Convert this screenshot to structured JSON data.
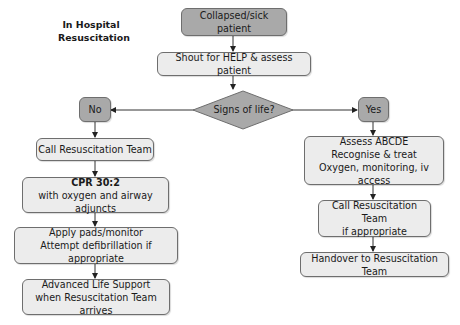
{
  "title": {
    "line1": "In Hospital",
    "line2": "Resuscitation"
  },
  "colors": {
    "dark_box": "#a9a9a9",
    "light_box": "#ececec",
    "border": "#6e6e6e",
    "line": "#333333"
  },
  "nodes": {
    "start": {
      "label": "Collapsed/sick patient"
    },
    "shout": {
      "label": "Shout for HELP & assess patient"
    },
    "decision": {
      "label": "Signs of life?"
    },
    "no": {
      "label": "No"
    },
    "yes": {
      "label": "Yes"
    },
    "left": {
      "call_team": {
        "label": "Call Resuscitation Team"
      },
      "cpr": {
        "line1": "CPR 30:2",
        "line2": "with oxygen and airway adjuncts"
      },
      "pads": {
        "line1": "Apply pads/monitor",
        "line2": "Attempt defibrillation if appropriate"
      },
      "als": {
        "line1": "Advanced Life Support",
        "line2": "when Resuscitation Team arrives"
      }
    },
    "right": {
      "assess": {
        "line1": "Assess ABCDE",
        "line2": "Recognise & treat",
        "line3": "Oxygen, monitoring, iv access"
      },
      "call_team": {
        "line1": "Call Resuscitation Team",
        "line2": "if appropriate"
      },
      "handover": {
        "label": "Handover to Resuscitation Team"
      }
    }
  }
}
